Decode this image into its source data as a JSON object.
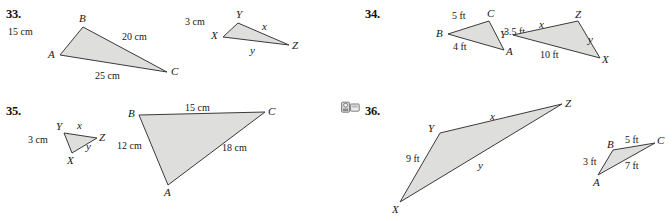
{
  "page": {
    "width": 672,
    "height": 221,
    "background": "#ffffff",
    "fill_color": "#dededd",
    "stroke_color": "#3a3a3a"
  },
  "problems": [
    {
      "number": "33.",
      "has_tech_icon": false,
      "figures": [
        {
          "name": "triangle-abc",
          "vertices": [
            {
              "label": "B",
              "x": 83,
              "y": 27
            },
            {
              "label": "C",
              "x": 167,
              "y": 72
            },
            {
              "label": "A",
              "x": 60,
              "y": 55
            }
          ],
          "side_labels": [
            {
              "text": "15 cm",
              "kind": "measure"
            },
            {
              "text": "20 cm",
              "kind": "measure"
            },
            {
              "text": "25 cm",
              "kind": "measure"
            }
          ]
        },
        {
          "name": "triangle-xyz",
          "vertices": [
            {
              "label": "Y",
              "x": 238,
              "y": 23
            },
            {
              "label": "Z",
              "x": 289,
              "y": 45
            },
            {
              "label": "X",
              "x": 223,
              "y": 37
            }
          ],
          "side_labels": [
            {
              "text": "3 cm",
              "kind": "measure"
            },
            {
              "text": "x",
              "kind": "variable"
            },
            {
              "text": "y",
              "kind": "variable"
            }
          ]
        }
      ]
    },
    {
      "number": "34.",
      "has_tech_icon": false,
      "figures": [
        {
          "name": "triangle-bca",
          "vertices": [
            {
              "label": "B",
              "x": 448,
              "y": 34
            },
            {
              "label": "C",
              "x": 489,
              "y": 21
            },
            {
              "label": "A",
              "x": 504,
              "y": 50
            }
          ],
          "side_labels": [
            {
              "text": "5 ft",
              "kind": "measure"
            },
            {
              "text": "3.5 ft",
              "kind": "measure"
            },
            {
              "text": "4 ft",
              "kind": "measure"
            }
          ]
        },
        {
          "name": "triangle-yzx",
          "vertices": [
            {
              "label": "Y",
              "x": 513,
              "y": 35
            },
            {
              "label": "Z",
              "x": 578,
              "y": 21
            },
            {
              "label": "X",
              "x": 600,
              "y": 58
            }
          ],
          "side_labels": [
            {
              "text": "x",
              "kind": "variable"
            },
            {
              "text": "y",
              "kind": "variable"
            },
            {
              "text": "10 ft",
              "kind": "measure"
            }
          ]
        }
      ]
    },
    {
      "number": "35.",
      "has_tech_icon": false,
      "figures": [
        {
          "name": "triangle-yzx-small",
          "vertices": [
            {
              "label": "Y",
              "x": 64,
              "y": 133
            },
            {
              "label": "Z",
              "x": 97,
              "y": 138
            },
            {
              "label": "X",
              "x": 72,
              "y": 153
            }
          ],
          "side_labels": [
            {
              "text": "x",
              "kind": "variable"
            },
            {
              "text": "y",
              "kind": "variable"
            },
            {
              "text": "3 cm",
              "kind": "measure"
            }
          ]
        },
        {
          "name": "triangle-bca-large",
          "vertices": [
            {
              "label": "B",
              "x": 139,
              "y": 115
            },
            {
              "label": "C",
              "x": 265,
              "y": 112
            },
            {
              "label": "A",
              "x": 168,
              "y": 185
            }
          ],
          "side_labels": [
            {
              "text": "15 cm",
              "kind": "measure"
            },
            {
              "text": "18 cm",
              "kind": "measure"
            },
            {
              "text": "12 cm",
              "kind": "measure"
            }
          ]
        }
      ]
    },
    {
      "number": "36.",
      "has_tech_icon": true,
      "tech_icon_name": "technology-calculator-icon",
      "figures": [
        {
          "name": "triangle-yzx-large",
          "vertices": [
            {
              "label": "Y",
              "x": 440,
              "y": 133
            },
            {
              "label": "Z",
              "x": 562,
              "y": 104
            },
            {
              "label": "X",
              "x": 400,
              "y": 202
            }
          ],
          "side_labels": [
            {
              "text": "x",
              "kind": "variable"
            },
            {
              "text": "y",
              "kind": "variable"
            },
            {
              "text": "9 ft",
              "kind": "measure"
            }
          ]
        },
        {
          "name": "triangle-bca-small",
          "vertices": [
            {
              "label": "B",
              "x": 613,
              "y": 150
            },
            {
              "label": "C",
              "x": 655,
              "y": 143
            },
            {
              "label": "A",
              "x": 598,
              "y": 175
            }
          ],
          "side_labels": [
            {
              "text": "5 ft",
              "kind": "measure"
            },
            {
              "text": "7 ft",
              "kind": "measure"
            },
            {
              "text": "3 ft",
              "kind": "measure"
            }
          ]
        }
      ]
    }
  ],
  "labels": {
    "p33": {
      "num": "33.",
      "n15cm": "15 cm",
      "n20cm": "20 cm",
      "n25cm": "25 cm",
      "vA": "A",
      "vB": "B",
      "vC": "C",
      "n3cm": "3 cm",
      "vx": "x",
      "vy": "y",
      "vX": "X",
      "vY": "Y",
      "vZ": "Z"
    },
    "p34": {
      "num": "34.",
      "n5ft": "5 ft",
      "n35ft": "3.5 ft",
      "n4ft": "4 ft",
      "vA": "A",
      "vB": "B",
      "vC": "C",
      "n10ft": "10 ft",
      "vx": "x",
      "vy": "y",
      "vX": "X",
      "vY": "Y",
      "vZ": "Z"
    },
    "p35": {
      "num": "35.",
      "n3cm": "3 cm",
      "vx": "x",
      "vy": "y",
      "vX": "X",
      "vY": "Y",
      "vZ": "Z",
      "n15cm": "15 cm",
      "n12cm": "12 cm",
      "n18cm": "18 cm",
      "vA": "A",
      "vB": "B",
      "vC": "C"
    },
    "p36": {
      "num": "36.",
      "n9ft": "9 ft",
      "vx": "x",
      "vy": "y",
      "vX": "X",
      "vY": "Y",
      "vZ": "Z",
      "n5ft": "5 ft",
      "n3ft": "3 ft",
      "n7ft": "7 ft",
      "vA": "A",
      "vB": "B",
      "vC": "C"
    }
  }
}
